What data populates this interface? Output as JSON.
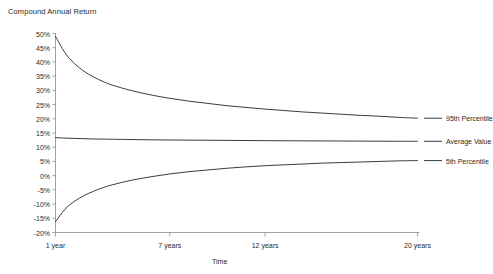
{
  "chart_data": {
    "type": "line",
    "title": "Compound Annual Return",
    "xlabel": "Time",
    "ylabel": "",
    "grid": false,
    "legend_position": "right",
    "xlim": [
      1,
      20
    ],
    "ylim": [
      -20,
      50
    ],
    "x_tick_labels": [
      "1 year",
      "7 years",
      "12 years",
      "20 years"
    ],
    "x_tick_values": [
      1,
      7,
      12,
      20
    ],
    "y_tick_labels": [
      "50%",
      "45%",
      "40%",
      "35%",
      "30%",
      "25%",
      "20%",
      "15%",
      "10%",
      "5%",
      "0%",
      "-5%",
      "-10%",
      "-15%",
      "-20%"
    ],
    "y_tick_values": [
      50,
      45,
      40,
      35,
      30,
      25,
      20,
      15,
      10,
      5,
      0,
      -5,
      -10,
      -15,
      -20
    ],
    "x": [
      1,
      1.5,
      2,
      2.5,
      3,
      3.5,
      4,
      5,
      6,
      7,
      8,
      9,
      10,
      11,
      12,
      13,
      14,
      15,
      16,
      17,
      18,
      19,
      20
    ],
    "series": [
      {
        "name": "95th Percentile",
        "color": "#262626",
        "values": [
          49.0,
          43.2,
          39.4,
          36.7,
          34.7,
          33.1,
          31.8,
          29.9,
          28.4,
          27.2,
          26.2,
          25.4,
          24.6,
          24.0,
          23.4,
          22.9,
          22.4,
          22.0,
          21.6,
          21.2,
          20.9,
          20.5,
          20.2
        ]
      },
      {
        "name": "Average Value",
        "color": "#262626",
        "values": [
          13.4,
          13.2,
          13.1,
          13.0,
          12.9,
          12.85,
          12.8,
          12.7,
          12.6,
          12.55,
          12.5,
          12.45,
          12.4,
          12.35,
          12.3,
          12.27,
          12.24,
          12.21,
          12.18,
          12.15,
          12.12,
          12.1,
          12.08
        ]
      },
      {
        "name": "5th Percentile",
        "color": "#262626",
        "values": [
          -16.2,
          -11.8,
          -9.0,
          -7.0,
          -5.5,
          -4.2,
          -3.2,
          -1.6,
          -0.4,
          0.6,
          1.4,
          2.0,
          2.6,
          3.1,
          3.5,
          3.8,
          4.1,
          4.4,
          4.6,
          4.8,
          5.0,
          5.2,
          5.3
        ]
      }
    ]
  },
  "legend": {
    "items": [
      {
        "label": "95th Percentile"
      },
      {
        "label": "Average Value"
      },
      {
        "label": "5th Percentile"
      }
    ]
  }
}
